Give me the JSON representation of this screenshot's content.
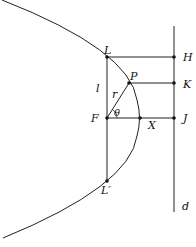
{
  "diagram": {
    "type": "conic-section-parabola",
    "labels": {
      "L": "L",
      "H": "H",
      "P": "P",
      "K": "K",
      "l": "l",
      "r": "r",
      "theta": "θ",
      "F": "F",
      "X": "X",
      "J": "J",
      "Lprime": "L′",
      "d": "d"
    },
    "colors": {
      "stroke": "#222222",
      "background": "#ffffff"
    }
  }
}
